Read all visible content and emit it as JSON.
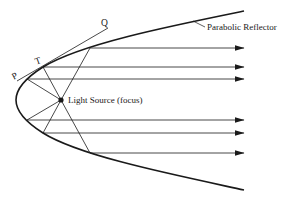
{
  "diagram": {
    "labels": {
      "reflector": "Parabolic Reflector",
      "focus": "Light Source (focus)",
      "point_p": "P",
      "point_t": "T",
      "point_q": "Q"
    },
    "geometry": {
      "vertex": [
        16,
        100
      ],
      "focus": [
        61,
        100
      ],
      "reflector_top_end": [
        244,
        11
      ],
      "reflector_bottom_end": [
        244,
        190
      ],
      "ray_end_x": 244,
      "rays": [
        {
          "id": "ray-1",
          "reflect_point": [
            90,
            48
          ]
        },
        {
          "id": "ray-2",
          "reflect_point": [
            43,
            67
          ]
        },
        {
          "id": "ray-3",
          "reflect_point": [
            27,
            79
          ]
        },
        {
          "id": "ray-4",
          "reflect_point": [
            27,
            120
          ]
        },
        {
          "id": "ray-5",
          "reflect_point": [
            43,
            133
          ]
        },
        {
          "id": "ray-6",
          "reflect_point": [
            90,
            153
          ]
        }
      ],
      "tangent_line": {
        "from": [
          17,
          81
        ],
        "to": [
          108,
          28
        ]
      }
    },
    "colors": {
      "line": "#1a1a1a",
      "background": "#ffffff"
    }
  }
}
